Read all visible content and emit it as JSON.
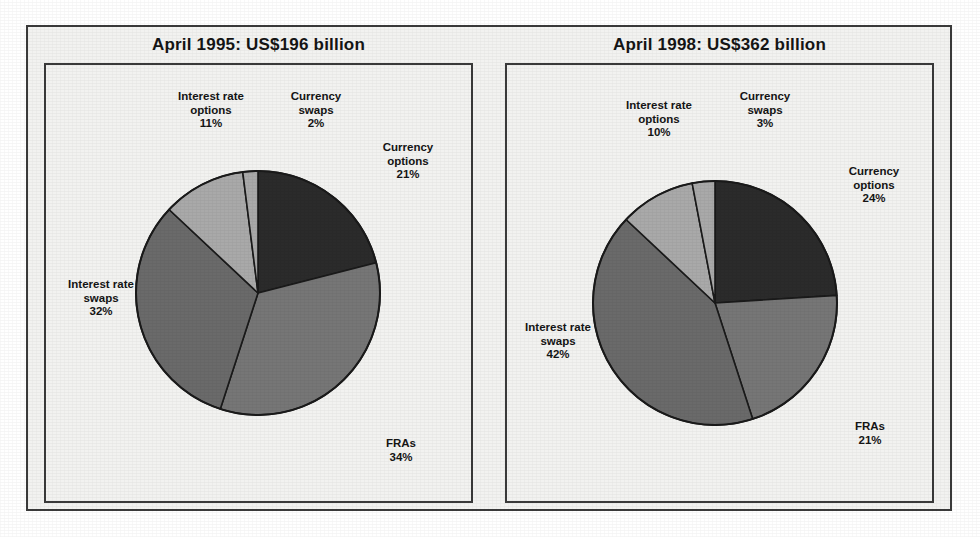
{
  "figure": {
    "background": "#f2f2f0",
    "frame_color": "#3a3a3a"
  },
  "palette": {
    "currency_options": "#2b2b2b",
    "fras": "#767676",
    "interest_rate_swaps": "#6a6a6a",
    "interest_rate_options": "#a9a9a9",
    "currency_swaps": "#a9a9a9",
    "slice_outline": "#1a1a1a",
    "text": "#151515"
  },
  "chart_data": [
    {
      "type": "pie",
      "title": "April 1995: US$196 billion",
      "period": "April 1995",
      "total_label": "US$196 billion",
      "total_value": 196,
      "currency": "US$",
      "units": "billion",
      "start_angle_deg": 0,
      "direction": "clockwise",
      "categories": [
        "Currency options",
        "FRAs",
        "Interest rate swaps",
        "Interest rate options",
        "Currency swaps"
      ],
      "values": [
        21,
        34,
        32,
        11,
        2
      ],
      "labels": [
        {
          "name": "Currency options",
          "pct": "21%",
          "text": "Currency\noptions\n21%"
        },
        {
          "name": "FRAs",
          "pct": "34%",
          "text": "FRAs\n34%"
        },
        {
          "name": "Interest rate swaps",
          "pct": "32%",
          "text": "Interest rate\nswaps\n32%"
        },
        {
          "name": "Interest rate options",
          "pct": "11%",
          "text": "Interest rate\noptions\n11%"
        },
        {
          "name": "Currency swaps",
          "pct": "2%",
          "text": "Currency\nswaps\n2%"
        }
      ],
      "colors": [
        "#2b2b2b",
        "#767676",
        "#6a6a6a",
        "#a9a9a9",
        "#a9a9a9"
      ],
      "legend": "none",
      "grid": false
    },
    {
      "type": "pie",
      "title": "April 1998: US$362 billion",
      "period": "April 1998",
      "total_label": "US$362 billion",
      "total_value": 362,
      "currency": "US$",
      "units": "billion",
      "start_angle_deg": 0,
      "direction": "clockwise",
      "categories": [
        "Currency options",
        "FRAs",
        "Interest rate swaps",
        "Interest rate options",
        "Currency swaps"
      ],
      "values": [
        24,
        21,
        42,
        10,
        3
      ],
      "labels": [
        {
          "name": "Currency options",
          "pct": "24%",
          "text": "Currency\noptions\n24%"
        },
        {
          "name": "FRAs",
          "pct": "21%",
          "text": "FRAs\n21%"
        },
        {
          "name": "Interest rate swaps",
          "pct": "42%",
          "text": "Interest rate\nswaps\n42%"
        },
        {
          "name": "Interest rate options",
          "pct": "10%",
          "text": "Interest rate\noptions\n10%"
        },
        {
          "name": "Currency swaps",
          "pct": "3%",
          "text": "Currency\nswaps\n3%"
        }
      ],
      "colors": [
        "#2b2b2b",
        "#767676",
        "#6a6a6a",
        "#a9a9a9",
        "#a9a9a9"
      ],
      "legend": "none",
      "grid": false
    }
  ],
  "left_panel": {
    "title": "April 1995: US$196 billion",
    "label_interest_rate_options": "Interest rate\noptions\n11%",
    "label_currency_swaps": "Currency\nswaps\n2%",
    "label_currency_options": "Currency\noptions\n21%",
    "label_fras": "FRAs\n34%",
    "label_interest_rate_swaps": "Interest rate\nswaps\n32%"
  },
  "right_panel": {
    "title": "April 1998: US$362 billion",
    "label_interest_rate_options": "Interest rate\noptions\n10%",
    "label_currency_swaps": "Currency\nswaps\n3%",
    "label_currency_options": "Currency\noptions\n24%",
    "label_fras": "FRAs\n21%",
    "label_interest_rate_swaps": "Interest rate\nswaps\n42%"
  }
}
